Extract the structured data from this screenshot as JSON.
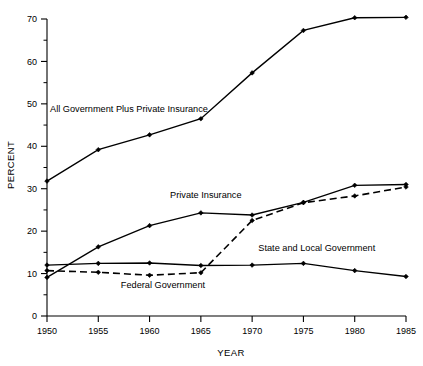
{
  "chart_data": {
    "type": "line",
    "title": "",
    "xlabel": "YEAR",
    "ylabel": "PERCENT",
    "x": [
      1950,
      1955,
      1960,
      1965,
      1970,
      1975,
      1980,
      1985
    ],
    "xtick_labels": [
      "1950",
      "1955",
      "1960",
      "1965",
      "1970",
      "1975",
      "1980",
      "1985"
    ],
    "ytick_labels": [
      "0",
      "10",
      "20",
      "30",
      "40",
      "50",
      "60",
      "70"
    ],
    "ytick_values": [
      0,
      10,
      20,
      30,
      40,
      50,
      60,
      70
    ],
    "yminor_values": [
      5,
      15,
      25,
      35,
      45,
      55,
      65
    ],
    "xlim": [
      1950,
      1985
    ],
    "ylim": [
      0,
      70
    ],
    "grid": false,
    "legend": "inline-annotations",
    "series": [
      {
        "name": "All Government Plus Private Insurance",
        "style": "solid",
        "marker": "diamond",
        "color": "#000000",
        "values": [
          31.8,
          39.2,
          42.7,
          46.5,
          57.3,
          67.3,
          70.3,
          70.4
        ]
      },
      {
        "name": "Private Insurance",
        "style": "solid",
        "marker": "diamond",
        "color": "#000000",
        "values": [
          9.1,
          16.3,
          21.3,
          24.3,
          23.8,
          26.8,
          30.8,
          31.0
        ]
      },
      {
        "name": "State and Local Government",
        "style": "solid",
        "marker": "diamond",
        "color": "#000000",
        "values": [
          12.0,
          12.4,
          12.5,
          11.9,
          12.0,
          12.4,
          10.7,
          9.3
        ]
      },
      {
        "name": "Federal Government",
        "style": "dashed",
        "marker": "diamond",
        "color": "#000000",
        "values": [
          10.7,
          10.3,
          9.6,
          10.2,
          22.5,
          26.7,
          28.3,
          30.4
        ]
      }
    ],
    "annotations": [
      {
        "text": "All Government Plus Private Insurance",
        "x": 1950.3,
        "y": 48.0
      },
      {
        "text": "Private Insurance",
        "x": 1962.0,
        "y": 27.8
      },
      {
        "text": "State and Local Government",
        "x": 1970.6,
        "y": 15.4
      },
      {
        "text": "Federal Government",
        "x": 1957.2,
        "y": 6.6
      }
    ]
  }
}
